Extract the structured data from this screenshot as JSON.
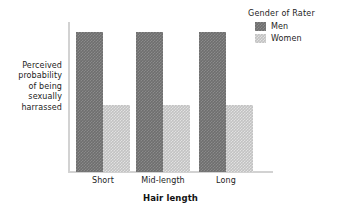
{
  "chart_data": {
    "type": "bar",
    "title": "",
    "subtitle": "",
    "xlabel": "Hair length",
    "ylabel": "Perceived probability of being sexually harrassed",
    "ylabel_lines": [
      "Perceived",
      "probability",
      "of being",
      "sexually",
      "harrassed"
    ],
    "categories": [
      "Short",
      "Mid-length",
      "Long"
    ],
    "series": [
      {
        "name": "Men",
        "color": "#6e6e6e",
        "values": [
          1.0,
          1.0,
          1.0
        ]
      },
      {
        "name": "Women",
        "color": "#c2c2c2",
        "values": [
          0.48,
          0.48,
          0.48
        ]
      }
    ],
    "ylim": [
      0,
      1.05
    ],
    "y_ticks": [],
    "y_tick_labels": [],
    "grid": false,
    "legend": {
      "title": "Gender of Rater",
      "position": "top-right",
      "entries": [
        {
          "label": "Men",
          "color": "#6e6e6e"
        },
        {
          "label": "Women",
          "color": "#c2c2c2"
        }
      ]
    },
    "axis_color": "#d2d2d2",
    "background": "#ffffff"
  }
}
